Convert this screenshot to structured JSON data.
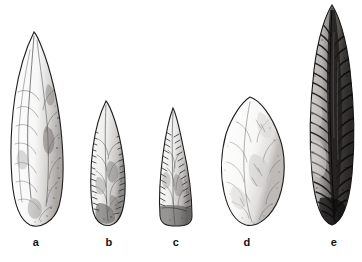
{
  "figure": {
    "type": "archaeological-illustration",
    "background_color": "#ffffff",
    "ink_color": "#1a1a1a",
    "width": 362,
    "height": 262
  },
  "captions": [
    {
      "label": "a",
      "x": 26,
      "y": 237
    },
    {
      "label": "b",
      "x": 99,
      "y": 237
    },
    {
      "label": "c",
      "x": 166,
      "y": 237
    },
    {
      "label": "d",
      "x": 237,
      "y": 237
    },
    {
      "label": "e",
      "x": 324,
      "y": 237
    }
  ],
  "artifacts": [
    {
      "id": "artifact-a",
      "label": "a",
      "name": "lanceolate-biface",
      "shading": "light",
      "x": 6,
      "y": 30,
      "width": 62,
      "height": 198
    },
    {
      "id": "artifact-b",
      "label": "b",
      "name": "serrated-leaf-point",
      "shading": "medium",
      "x": 84,
      "y": 99,
      "width": 48,
      "height": 129
    },
    {
      "id": "artifact-c",
      "label": "c",
      "name": "triangular-point",
      "shading": "medium",
      "x": 150,
      "y": 106,
      "width": 52,
      "height": 122
    },
    {
      "id": "artifact-d",
      "label": "d",
      "name": "ovate-biface",
      "shading": "light",
      "x": 216,
      "y": 94,
      "width": 74,
      "height": 134
    },
    {
      "id": "artifact-e",
      "label": "e",
      "name": "parallel-flaked-blade",
      "shading": "dark",
      "x": 304,
      "y": 2,
      "width": 56,
      "height": 226
    }
  ]
}
